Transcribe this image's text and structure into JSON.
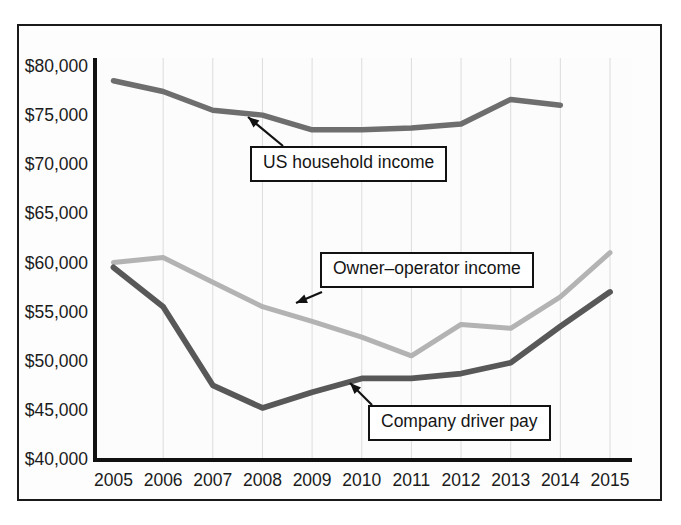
{
  "chart_data": {
    "type": "line",
    "title": "",
    "subtitle": "",
    "xlabel": "",
    "ylabel": "",
    "x": [
      2005,
      2006,
      2007,
      2008,
      2009,
      2010,
      2011,
      2012,
      2013,
      2014,
      2015
    ],
    "categories": [
      "2005",
      "2006",
      "2007",
      "2008",
      "2009",
      "2010",
      "2011",
      "2012",
      "2013",
      "2014",
      "2015"
    ],
    "xlim": [
      2005,
      2015
    ],
    "ylim": [
      40000,
      80000
    ],
    "ytick_values": [
      40000,
      45000,
      50000,
      55000,
      60000,
      65000,
      70000,
      75000,
      80000
    ],
    "ytick_labels": [
      "$40,000",
      "$45,000",
      "$50,000",
      "$55,000",
      "$60,000",
      "$65,000",
      "$70,000",
      "$75,000",
      "$80,000"
    ],
    "xtick_labels": [
      "2005",
      "2006",
      "2007",
      "2008",
      "2009",
      "2010",
      "2011",
      "2012",
      "2013",
      "2014",
      "2015"
    ],
    "grid": {
      "vertical": true,
      "horizontal": false
    },
    "legend_position": "inline-callouts",
    "series": [
      {
        "name": "US household income",
        "color": "#6e6e6e",
        "width": 5.5,
        "values": [
          78500,
          77400,
          75500,
          75000,
          73500,
          73500,
          73700,
          74100,
          76600,
          76000,
          null
        ]
      },
      {
        "name": "Owner-operator income",
        "color": "#b3b3b3",
        "width": 5.0,
        "values": [
          60000,
          60500,
          58000,
          55500,
          54000,
          52400,
          50500,
          53700,
          53300,
          56500,
          61000
        ]
      },
      {
        "name": "Company driver pay",
        "color": "#585858",
        "width": 5.8,
        "values": [
          59500,
          55500,
          47500,
          45200,
          46800,
          48200,
          48200,
          48700,
          49800,
          53500,
          57000
        ]
      }
    ],
    "annotations": [
      {
        "id": "callout-household",
        "label": "US household income",
        "points_to_series": "US household income",
        "points_to_x": 2008
      },
      {
        "id": "callout-owner",
        "label": "Owner–operator income",
        "points_to_series": "Owner-operator income",
        "points_to_x": 2009
      },
      {
        "id": "callout-driver",
        "label": "Company driver pay",
        "points_to_series": "Company driver pay",
        "points_to_x": 2010
      }
    ]
  },
  "colors": {
    "frame": "#1a1a1a",
    "axis": "#111111",
    "gridline": "#d8d8d8",
    "background": "#fdfdfd",
    "text": "#1b1b1b",
    "series_household": "#6e6e6e",
    "series_owner": "#b3b3b3",
    "series_driver": "#585858"
  },
  "axis": {
    "y_labels": [
      "$80,000",
      "$75,000",
      "$70,000",
      "$65,000",
      "$60,000",
      "$55,000",
      "$50,000",
      "$45,000",
      "$40,000"
    ],
    "x_labels": [
      "2005",
      "2006",
      "2007",
      "2008",
      "2009",
      "2010",
      "2011",
      "2012",
      "2013",
      "2014",
      "2015"
    ]
  },
  "callouts": {
    "household": "US household income",
    "owner": "Owner–operator income",
    "driver": "Company driver pay"
  }
}
